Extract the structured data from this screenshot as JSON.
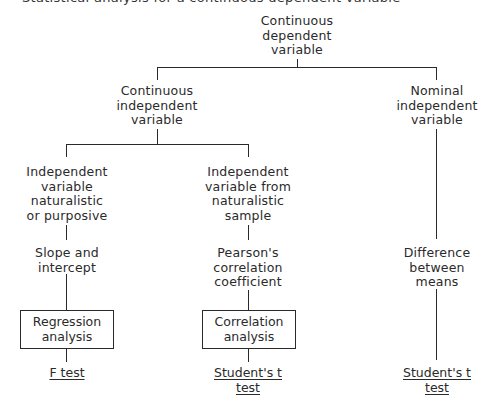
{
  "header": {
    "cut_caption": "Statistical analysis for a continuous dependent variable"
  },
  "diagram": {
    "root": {
      "label": "Continuous\ndependent\nvariable"
    },
    "branches": {
      "continuous_iv": {
        "label": "Continuous\nindependent\nvariable"
      },
      "nominal_iv": {
        "label": "Nominal\nindependent\nvariable"
      }
    },
    "continuous_children": {
      "purposive": {
        "label": "Independent\nvariable\nnaturalistic\nor purposive"
      },
      "naturalistic": {
        "label": "Independent\nvariable from\nnaturalistic\nsample"
      }
    },
    "measures": {
      "slope": {
        "label": "Slope and\nintercept"
      },
      "pearson": {
        "label": "Pearson's\ncorrelation\ncoefficient"
      },
      "difference": {
        "label": "Difference\nbetween\nmeans"
      }
    },
    "analyses": {
      "regression": {
        "label": "Regression\nanalysis"
      },
      "correlation": {
        "label": "Correlation\nanalysis"
      }
    },
    "tests": {
      "f_test": {
        "line1": "F test"
      },
      "students_t_corr": {
        "line1": "Student's t",
        "line2": "test"
      },
      "students_t_means": {
        "line1": "Student's t",
        "line2": "test"
      }
    }
  }
}
